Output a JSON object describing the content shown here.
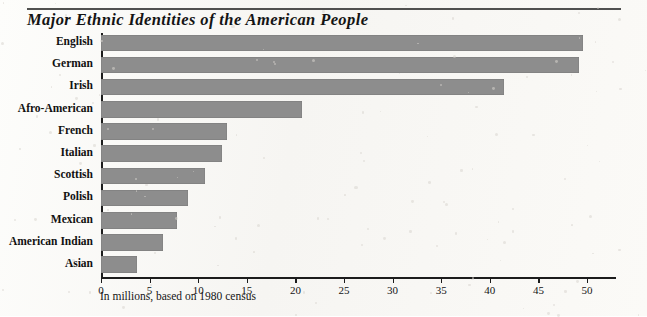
{
  "chart_data": {
    "type": "bar",
    "orientation": "horizontal",
    "title": "Major Ethnic Identities of the American People",
    "caption": "In millions, based on 1980 census",
    "xlabel": "",
    "ylabel": "",
    "xlim": [
      0,
      53
    ],
    "grid": false,
    "legend": null,
    "bar_color": "#8d8d8d",
    "axis_color": "#1c1c1c",
    "categories": [
      "English",
      "German",
      "Irish",
      "Afro-American",
      "French",
      "Italian",
      "Scottish",
      "Polish",
      "Mexican",
      "American Indian",
      "Asian"
    ],
    "values": [
      49.6,
      49.2,
      41.5,
      20.7,
      13.0,
      12.4,
      10.7,
      8.9,
      7.8,
      6.4,
      3.7
    ],
    "xticks": [
      0,
      5,
      10,
      15,
      20,
      25,
      30,
      35,
      40,
      45,
      50
    ],
    "xticklabels": [
      "0",
      "5",
      "10",
      "15",
      "20",
      "25",
      "30",
      "35",
      "40",
      "45",
      "50"
    ]
  }
}
